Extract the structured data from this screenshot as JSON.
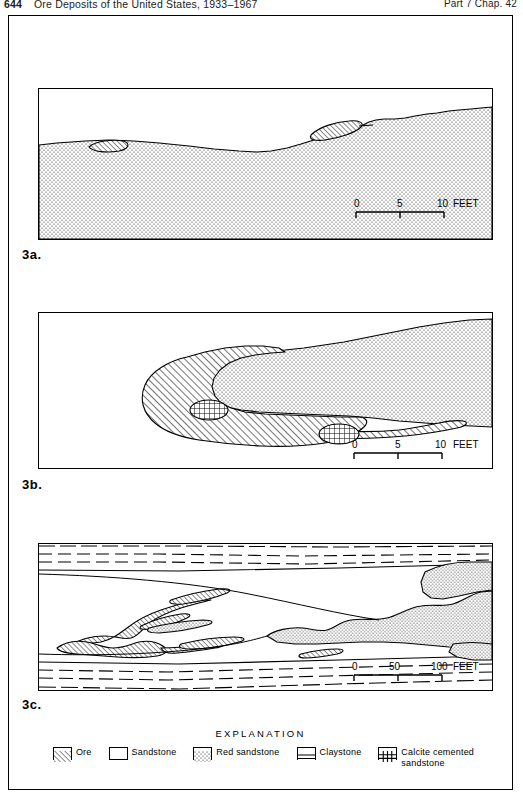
{
  "running_head": {
    "folio": "644",
    "book_title": "Ore Deposits of the United States, 1933–1967",
    "part_chapter": "Part 7  Chap. 42"
  },
  "panels": [
    {
      "id": "3a",
      "label": "3a.",
      "name": "panel-3a-cross-section",
      "description": "Longitudinal section showing tabular ore lenses at the contact between overlying sandstone and underlying red sandstone",
      "scale": {
        "ticks": [
          "0",
          "5",
          "10"
        ],
        "unit": "FEET",
        "label": "0 5 10 FEET"
      }
    },
    {
      "id": "3b",
      "label": "3b.",
      "name": "panel-3b-cross-section",
      "description": "Cross section of a roll-type ore body enclosing a red sandstone core with calcite cemented sandstone concretions",
      "scale": {
        "ticks": [
          "0",
          "5",
          "10"
        ],
        "unit": "FEET",
        "label": "0 5 10 FEET"
      }
    },
    {
      "id": "3c",
      "label": "3c.",
      "name": "panel-3c-plan-map",
      "description": "Plan map of ore bodies and red sandstone tongues between upper and lower claystone beds",
      "scale": {
        "ticks": [
          "0",
          "50",
          "100"
        ],
        "unit": "FEET",
        "label": "0 50 100 FEET"
      }
    }
  ],
  "legend": {
    "title": "EXPLANATION",
    "items": [
      {
        "key": "ore",
        "label": "Ore",
        "pattern": "diagonal-hatch"
      },
      {
        "key": "sandstone",
        "label": "Sandstone",
        "pattern": "blank-white"
      },
      {
        "key": "red_ss",
        "label": "Red sandstone",
        "pattern": "stipple-dots"
      },
      {
        "key": "claystone",
        "label": "Claystone",
        "pattern": "horizontal-lines"
      },
      {
        "key": "calcite",
        "label": "Calcite cemented\nsandstone",
        "pattern": "cross-grid"
      }
    ]
  },
  "colors": {
    "ink": "#000000",
    "paper": "#ffffff",
    "stipple": "#1a1a1a"
  }
}
